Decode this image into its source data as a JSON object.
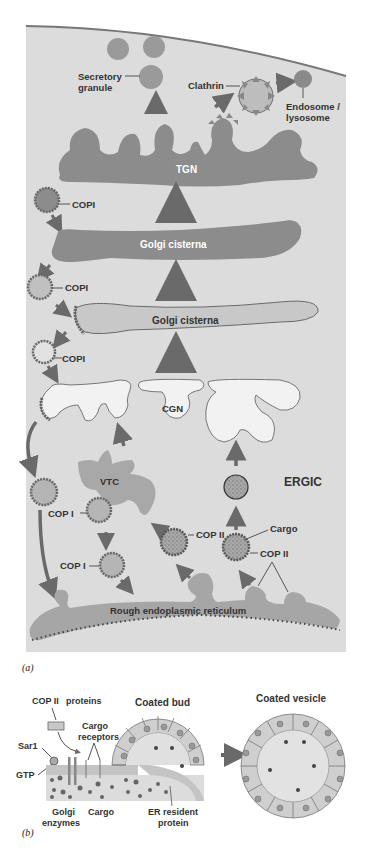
{
  "panel_a": {
    "caption": "(a)",
    "labels": {
      "secretory_granule_line1": "Secretory",
      "secretory_granule_line2": "granule",
      "clathrin": "Clathrin",
      "endosome_line1": "Endosome /",
      "endosome_line2": "lysosome",
      "tgn": "TGN",
      "copi_1": "COPI",
      "golgi_cisterna_1": "Golgi cisterna",
      "copi_2": "COPI",
      "golgi_cisterna_2": "Golgi cisterna",
      "copi_3": "COPI",
      "cgn": "CGN",
      "vtc": "VTC",
      "ergic": "ERGIC",
      "cop_i_1": "COP I",
      "cop_i_2": "COP I",
      "cop_ii_1": "COP II",
      "cargo": "Cargo",
      "cop_ii_2": "COP II",
      "rough_er": "Rough endoplasmic reticulum"
    }
  },
  "panel_b": {
    "caption": "(b)",
    "labels": {
      "cop_ii": "COP II",
      "proteins": "proteins",
      "coated_bud": "Coated bud",
      "coated_vesicle": "Coated vesicle",
      "cargo_receptors_line1": "Cargo",
      "cargo_receptors_line2": "receptors",
      "sar1": "Sar1",
      "gtp": "GTP",
      "golgi_enzymes_line1": "Golgi",
      "golgi_enzymes_line2": "enzymes",
      "cargo": "Cargo",
      "er_resident_line1": "ER resident",
      "er_resident_line2": "protein"
    }
  },
  "colors": {
    "cytoplasm": "#dcdcdc",
    "dark_organelle": "#8c8c8c",
    "mid_organelle": "#a6a6a6",
    "light_organelle": "#c8c8c8",
    "arrow": "#6a6a6a",
    "membrane": "#5a5a5a"
  }
}
